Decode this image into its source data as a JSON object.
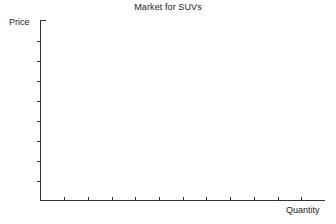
{
  "chart_data": {
    "type": "line",
    "title": "Market for SUVs",
    "xlabel": "Quantity",
    "ylabel": "Price",
    "series": [],
    "x": [],
    "values": [],
    "categories": [],
    "xlim": [
      0,
      11
    ],
    "ylim": [
      0,
      9
    ],
    "grid": false,
    "legend": false,
    "legend_position": "none",
    "annotations": [],
    "x_tick_labels": [],
    "y_tick_labels": [],
    "x_tick_count": 11,
    "y_tick_count": 8
  },
  "figure": {
    "title": "Market for SUVs",
    "y_axis": {
      "label": "Price",
      "tick_count": 8,
      "tick_direction": "left",
      "top_cap": true
    },
    "x_axis": {
      "label": "Quantity",
      "tick_count": 11,
      "tick_direction": "up"
    },
    "colors": {
      "background": "#ffffff",
      "axis": "#333333",
      "text": "#1a1a1a"
    }
  }
}
